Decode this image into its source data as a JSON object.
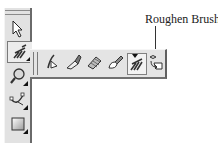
{
  "callout": {
    "label": "Roughen Brush"
  },
  "toolbox": {
    "tools": [
      {
        "name": "pick-tool",
        "icon": "arrow-pointer-icon",
        "has_flyout": false
      },
      {
        "name": "shape-edit-tool",
        "icon": "roughen-brush-icon",
        "has_flyout": true,
        "active": true
      },
      {
        "name": "zoom-tool",
        "icon": "magnifier-icon",
        "has_flyout": true
      },
      {
        "name": "curve-tool",
        "icon": "bezier-curve-icon",
        "has_flyout": true
      },
      {
        "name": "rectangle-tool",
        "icon": "rectangle-icon",
        "has_flyout": true
      }
    ]
  },
  "flyout": {
    "tools": [
      {
        "name": "shape-tool",
        "icon": "shape-node-icon"
      },
      {
        "name": "knife-tool",
        "icon": "knife-icon"
      },
      {
        "name": "eraser-tool",
        "icon": "eraser-icon"
      },
      {
        "name": "smudge-brush-tool",
        "icon": "smudge-brush-icon"
      },
      {
        "name": "roughen-brush-tool",
        "icon": "roughen-brush-icon",
        "selected": true
      },
      {
        "name": "free-transform-tool",
        "icon": "free-transform-icon"
      }
    ]
  }
}
